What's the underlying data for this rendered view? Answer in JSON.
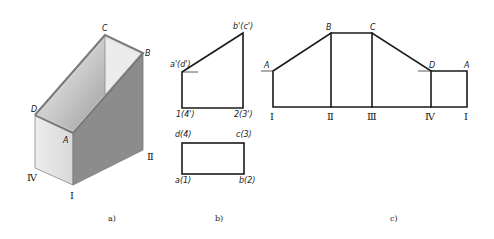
{
  "figure": {
    "panels": [
      {
        "id": "a",
        "caption": "a)",
        "description": "Isometric view of prism with sloped top face",
        "vertex_labels": {
          "A": "A",
          "B": "B",
          "C": "C",
          "D": "D"
        },
        "edge_labels": {
          "I": "Ⅰ",
          "II": "Ⅱ",
          "IV": "Ⅳ"
        },
        "colors": {
          "left_face": "#e4e4e4",
          "right_face": "#8c8c8c",
          "top_face_light": "#f2f2f2",
          "top_face_dark": "#a8a8a8",
          "edge": "#7a7a7a"
        }
      },
      {
        "id": "b",
        "caption": "b)",
        "front_view_labels": {
          "top_right": "b'(c')",
          "left_top": "a'(d')",
          "bottom_left": "1(4')",
          "bottom_right": "2(3')"
        },
        "top_view_labels": {
          "top_left": "d(4)",
          "top_right": "c(3)",
          "bottom_left": "a(1)",
          "bottom_right": "b(2)"
        }
      },
      {
        "id": "c",
        "caption": "c)",
        "description": "Unfolded development of the lateral surface",
        "vertex_labels": [
          "A",
          "B",
          "C",
          "D",
          "A"
        ],
        "base_labels": [
          "Ⅰ",
          "Ⅱ",
          "Ⅲ",
          "Ⅳ",
          "Ⅰ"
        ]
      }
    ]
  }
}
